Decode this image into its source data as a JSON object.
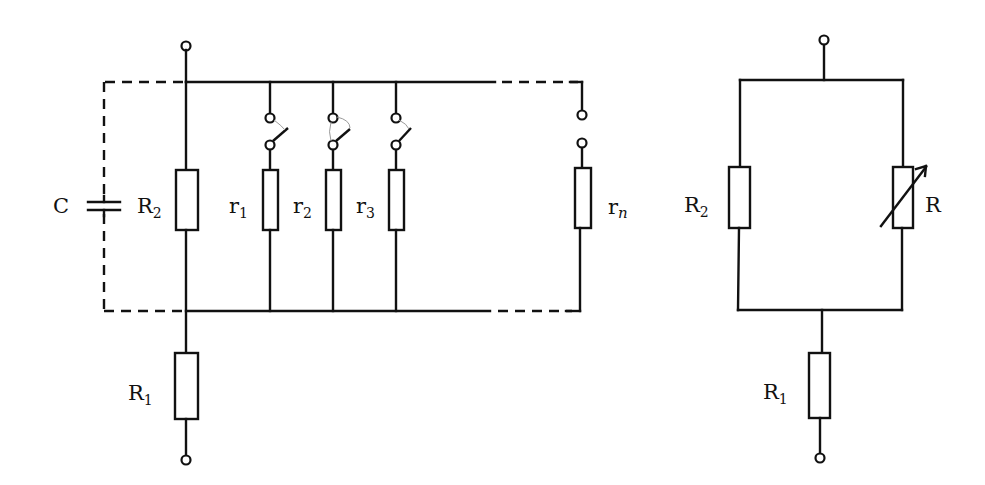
{
  "left_circuit": {
    "capacitor": {
      "label": "C"
    },
    "resistor_r2": {
      "label": "R",
      "subscript": "2"
    },
    "resistor_r1": {
      "label": "R",
      "subscript": "1"
    },
    "branches": [
      {
        "label": "r",
        "subscript": "1"
      },
      {
        "label": "r",
        "subscript": "2"
      },
      {
        "label": "r",
        "subscript": "3"
      },
      {
        "label": "r",
        "subscript": "n"
      }
    ]
  },
  "right_circuit": {
    "resistor_r2": {
      "label": "R",
      "subscript": "2"
    },
    "variable_resistor": {
      "label": "R"
    },
    "resistor_r1": {
      "label": "R",
      "subscript": "1"
    }
  },
  "colors": {
    "line": "#111111",
    "background": "#ffffff"
  }
}
